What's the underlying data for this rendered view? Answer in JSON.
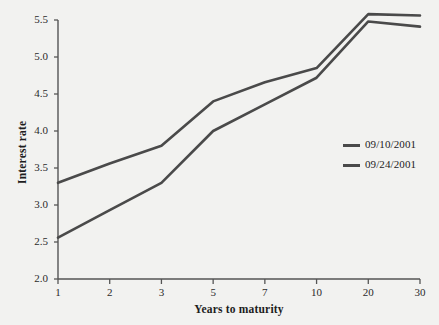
{
  "chart_data": {
    "type": "line",
    "title": "",
    "xlabel": "Years to maturity",
    "ylabel": "Interest rate",
    "categories": [
      "1",
      "2",
      "3",
      "5",
      "7",
      "10",
      "20",
      "30"
    ],
    "yticks": [
      "2.0",
      "2.5",
      "3.0",
      "3.5",
      "4.0",
      "4.5",
      "5.0",
      "5.5"
    ],
    "ylim": [
      2.0,
      5.5
    ],
    "grid": false,
    "legend_position": "center-right",
    "series": [
      {
        "name": "09/10/2001",
        "color": "#4a4a4a",
        "values": [
          3.3,
          3.56,
          3.8,
          4.4,
          4.66,
          4.85,
          5.58,
          5.56
        ]
      },
      {
        "name": "09/24/2001",
        "color": "#4a4a4a",
        "values": [
          2.56,
          2.93,
          3.3,
          4.0,
          4.36,
          4.72,
          5.48,
          5.41
        ]
      }
    ]
  },
  "legend": {
    "entries": [
      {
        "label": "09/10/2001"
      },
      {
        "label": "09/24/2001"
      }
    ]
  },
  "colors": {
    "background": "#f2f2f0",
    "line": "#4a4a4a",
    "axis": "#555555",
    "text": "#1d1d1d"
  }
}
